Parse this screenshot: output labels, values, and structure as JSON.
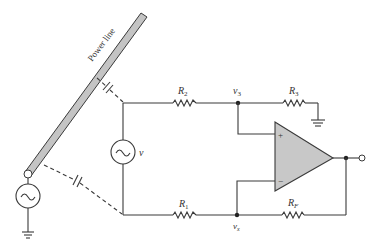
{
  "diagram": {
    "type": "circuit",
    "title": "",
    "power_line_label": "Power line",
    "components": {
      "R1": {
        "label": "R",
        "sub": "1"
      },
      "R2": {
        "label": "R",
        "sub": "2"
      },
      "R3": {
        "label": "R",
        "sub": "3"
      },
      "RF": {
        "label": "R",
        "sub": "F"
      },
      "source_v": {
        "label": "v"
      },
      "power_source": {
        "label": ""
      },
      "opamp": {
        "plus": "+",
        "minus": "−"
      }
    },
    "nodes": {
      "v3": {
        "label": "v",
        "sub": "3"
      },
      "vx": {
        "label": "v",
        "sub": "x"
      }
    },
    "colors": {
      "line": "#3a3a3a",
      "opamp_fill": "#c8c8c8",
      "power_line_fill": "#c4c4c4"
    }
  }
}
